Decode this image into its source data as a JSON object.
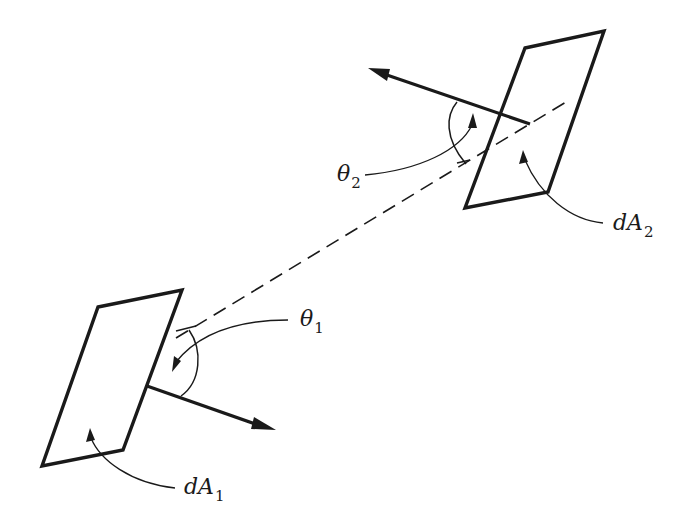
{
  "diagram": {
    "type": "radiation view factor geometry",
    "colors": {
      "stroke": "#1a1a1a",
      "background": "#ffffff"
    },
    "surfaces": [
      {
        "id": "dA1",
        "label": "dA",
        "subscript": "1"
      },
      {
        "id": "dA2",
        "label": "dA",
        "subscript": "2"
      }
    ],
    "angles": [
      {
        "id": "theta1",
        "label": "θ",
        "subscript": "1"
      },
      {
        "id": "theta2",
        "label": "θ",
        "subscript": "2"
      }
    ],
    "connections": [
      {
        "from": "dA1",
        "to": "dA2",
        "style": "dashed",
        "meaning": "line of sight"
      }
    ],
    "normals": [
      {
        "surface": "dA1",
        "direction": "lower-right"
      },
      {
        "surface": "dA2",
        "direction": "upper-left"
      }
    ]
  }
}
